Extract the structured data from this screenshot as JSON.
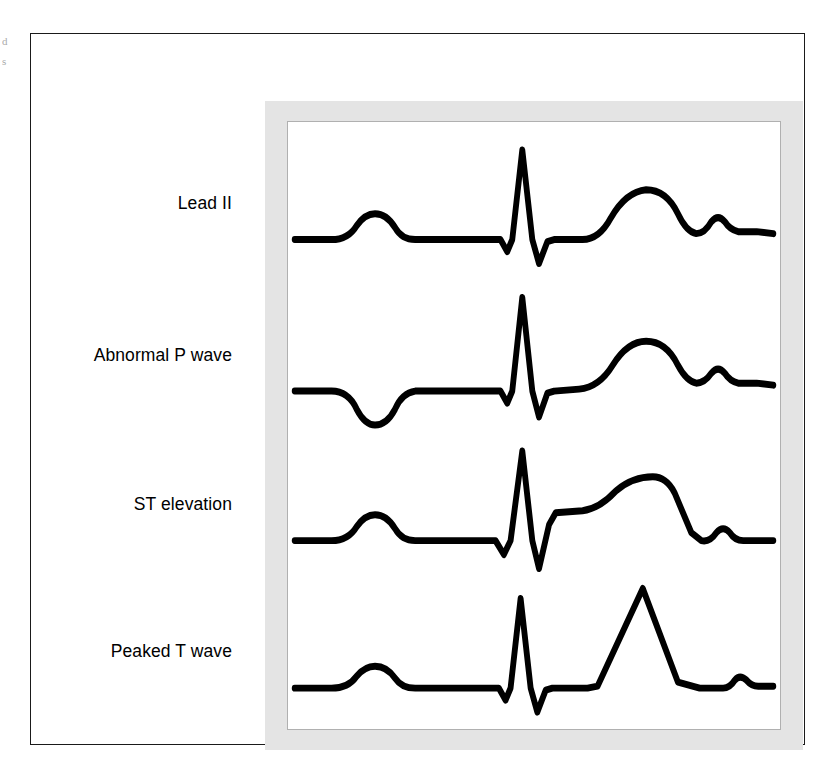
{
  "figure": {
    "kind": "ecg-rhythm-strip-comparison",
    "background_color": "#ffffff",
    "frame_color": "#1a1a1a",
    "mat_color": "#e4e4e4",
    "plot_border_color": "#b0b0b0",
    "trace_color": "#000000",
    "trace_width": 7
  },
  "margin_slivers": {
    "line_1": "d",
    "line_2": "s"
  },
  "traces": [
    {
      "id": "lead-ii",
      "label": "Lead II",
      "baseline": 118,
      "features": {
        "p_wave": "upright, small, rounded",
        "q_wave": "small negative deflection",
        "r_wave": "tall sharp positive spike",
        "s_wave": "negative deflection below baseline",
        "st_segment": "isoelectric, level with baseline",
        "t_wave": "broad rounded upright",
        "u_wave": "small rounded bump"
      },
      "path": "M 8 118 L 52 118 Q 72 118 82 104 Q 92 92 104 92 Q 118 92 128 106 Q 136 118 152 118 L 254 118 L 262 130 L 268 118 L 280 28 L 292 118 L 300 142 L 310 120 L 318 118 L 352 118 Q 372 118 386 96 Q 404 70 428 68 Q 452 68 466 92 Q 476 110 488 112 Q 498 112 506 100 Q 514 92 522 100 Q 528 108 538 110 L 560 110 L 580 112"
    },
    {
      "id": "abnormal-p-wave",
      "label": "Abnormal P wave",
      "baseline": 270,
      "features": {
        "p_wave": "INVERTED (negative) P wave below baseline",
        "q_wave": "minimal",
        "r_wave": "tall sharp positive spike",
        "s_wave": "negative deflection below baseline",
        "st_segment": "isoelectric",
        "t_wave": "broad rounded upright",
        "u_wave": "small rounded bump"
      },
      "path": "M 8 270 L 52 270 Q 72 270 82 288 Q 92 304 104 304 Q 118 304 128 288 Q 136 272 152 270 L 254 270 L 262 282 L 268 270 L 280 176 L 292 270 L 300 296 L 310 272 L 318 270 L 348 268 Q 372 266 388 244 Q 406 220 428 220 Q 452 220 466 244 Q 476 260 488 262 Q 498 262 506 252 Q 514 244 522 252 Q 528 260 538 262 L 560 262 L 580 264"
    },
    {
      "id": "st-elevation",
      "label": "ST elevation",
      "baseline": 420,
      "features": {
        "p_wave": "upright, small, rounded",
        "q_wave": "small negative deflection",
        "r_wave": "tall sharp positive spike",
        "s_wave": "deep negative deflection",
        "st_segment": "ELEVATED above baseline, coved plateau merging into T wave",
        "t_wave": "broad elevated dome, descends steeply",
        "u_wave": "small rounded bump"
      },
      "path": "M 8 420 L 52 420 Q 72 420 82 406 Q 92 394 104 394 Q 118 394 128 408 Q 136 420 152 420 L 248 420 L 258 434 L 266 420 L 280 330 L 292 420 L 300 448 L 312 404 L 320 392 L 352 390 Q 372 388 392 370 Q 412 356 436 356 Q 452 356 462 372 Q 472 392 482 412 L 494 420 Q 504 422 512 412 Q 520 404 528 412 Q 534 420 544 420 L 564 420 L 580 420"
    },
    {
      "id": "peaked-t-wave",
      "label": "Peaked T wave",
      "baseline": 568,
      "features": {
        "p_wave": "upright, small, rounded",
        "q_wave": "small negative deflection",
        "r_wave": "tall sharp positive spike",
        "s_wave": "negative deflection below baseline",
        "st_segment": "isoelectric, short",
        "t_wave": "TALL, narrow, sharply pointed tent-shaped",
        "u_wave": "small rounded bump"
      },
      "path": "M 8 568 L 52 568 Q 72 568 82 556 Q 92 546 104 546 Q 118 546 128 558 Q 136 568 152 568 L 252 568 L 260 580 L 266 568 L 278 478 L 290 568 L 298 592 L 308 570 L 316 568 L 358 568 L 370 566 L 424 468 L 466 562 L 492 568 L 520 568 Q 528 568 534 560 Q 540 554 548 560 Q 554 566 562 566 L 580 566"
    }
  ]
}
